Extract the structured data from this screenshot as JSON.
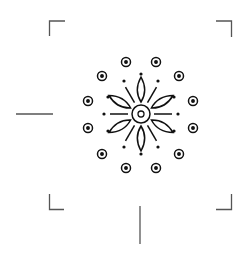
{
  "canvas": {
    "width": 248,
    "height": 255,
    "background": "#ffffff"
  },
  "colors": {
    "ink": "#111111",
    "frame": "#555555"
  },
  "viewfinder": {
    "corners": [
      "top-left",
      "top-right",
      "bottom-left",
      "bottom-right"
    ],
    "tick_lines": [
      "left-horizontal",
      "bottom-vertical"
    ]
  },
  "figure": {
    "name": "mandala-flower-icon",
    "center": [
      141,
      114
    ],
    "petal_count": 8,
    "ray_count": 8,
    "dot_count": 8,
    "ring_circle_count": 12
  }
}
